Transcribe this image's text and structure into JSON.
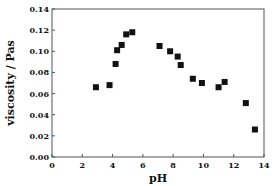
{
  "chart_data": {
    "type": "scatter",
    "title": "",
    "xlabel": "pH",
    "ylabel": "viscosity / Pas",
    "xlim": [
      0,
      14
    ],
    "ylim": [
      0.0,
      0.14
    ],
    "xticks": [
      0,
      2,
      4,
      6,
      8,
      10,
      12,
      14
    ],
    "xtick_labels": [
      "0",
      "2",
      "4",
      "6",
      "8",
      "10",
      "12",
      "14"
    ],
    "yticks": [
      0.0,
      0.02,
      0.04,
      0.06,
      0.08,
      0.1,
      0.12,
      0.14
    ],
    "ytick_labels": [
      "0.00",
      "0.02",
      "0.04",
      "0.06",
      "0.08",
      "0.10",
      "0.12",
      "0.14"
    ],
    "grid": false,
    "legend": null,
    "marker": "filled-square",
    "marker_color": "#111111",
    "series": [
      {
        "name": "viscosity",
        "x": [
          2.9,
          3.8,
          4.2,
          4.3,
          4.6,
          4.9,
          5.3,
          7.1,
          7.8,
          8.3,
          8.5,
          9.3,
          9.9,
          11.0,
          11.4,
          12.8,
          13.4
        ],
        "y": [
          0.066,
          0.068,
          0.088,
          0.101,
          0.106,
          0.116,
          0.118,
          0.105,
          0.1,
          0.095,
          0.087,
          0.074,
          0.07,
          0.066,
          0.071,
          0.051,
          0.026
        ]
      }
    ]
  }
}
